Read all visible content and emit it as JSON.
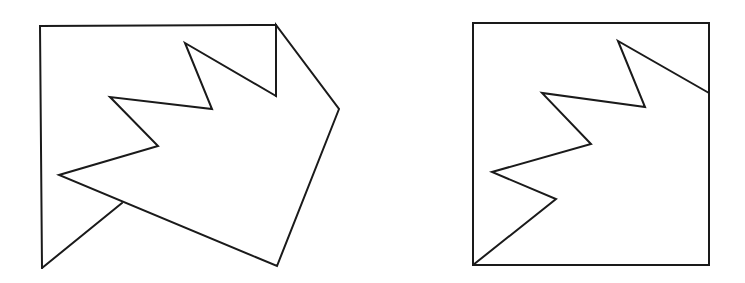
{
  "diagram": {
    "background": "#ffffff",
    "stroke_color": "#1a1a1a",
    "stroke_width": 2,
    "figures": [
      {
        "id": "left-figure",
        "description": "Open frame with a zigzag polygon overlapping a diagonal strut",
        "frame_polyline": [
          [
            42,
            268
          ],
          [
            40,
            26
          ],
          [
            276,
            25
          ],
          [
            276,
            96
          ]
        ],
        "strut_line": [
          [
            42,
            268
          ],
          [
            122,
            203
          ]
        ],
        "zigzag_polygon": [
          [
            276,
            96
          ],
          [
            185,
            43
          ],
          [
            212,
            109
          ],
          [
            110,
            97
          ],
          [
            158,
            146
          ],
          [
            59,
            175
          ],
          [
            277,
            266
          ],
          [
            339,
            109
          ],
          [
            276,
            25
          ]
        ]
      },
      {
        "id": "right-figure",
        "description": "Square containing a zigzag line from the bottom-left corner to the right edge",
        "square": {
          "x": 473,
          "y": 23,
          "width": 236,
          "height": 242
        },
        "zigzag_polyline": [
          [
            709,
            93
          ],
          [
            618,
            41
          ],
          [
            645,
            107
          ],
          [
            542,
            93
          ],
          [
            591,
            144
          ],
          [
            492,
            172
          ],
          [
            556,
            199
          ],
          [
            473,
            265
          ]
        ]
      }
    ]
  }
}
